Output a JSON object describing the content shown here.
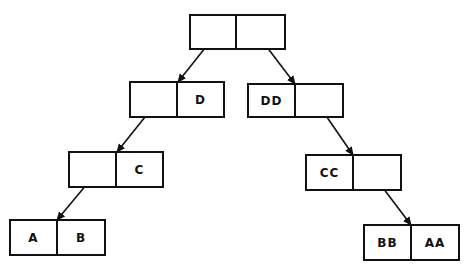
{
  "diagram": {
    "type": "binary-tree-cons-cells",
    "nodes": [
      {
        "id": "root",
        "left": "",
        "right": "",
        "x": 190,
        "y": 15,
        "w": 95,
        "h": 34,
        "div": 236
      },
      {
        "id": "n_left",
        "left": "",
        "right": "D",
        "x": 130,
        "y": 82,
        "w": 94,
        "h": 35,
        "div": 177
      },
      {
        "id": "n_right",
        "left": "DD",
        "right": "",
        "x": 248,
        "y": 84,
        "w": 95,
        "h": 33,
        "div": 295
      },
      {
        "id": "n_c",
        "left": "",
        "right": "C",
        "x": 69,
        "y": 152,
        "w": 94,
        "h": 35,
        "div": 116
      },
      {
        "id": "n_cc",
        "left": "CC",
        "right": "",
        "x": 306,
        "y": 155,
        "w": 95,
        "h": 35,
        "div": 353
      },
      {
        "id": "n_ab",
        "left": "A",
        "right": "B",
        "x": 10,
        "y": 220,
        "w": 95,
        "h": 35,
        "div": 57
      },
      {
        "id": "n_bbaa",
        "left": "BB",
        "right": "AA",
        "x": 364,
        "y": 225,
        "w": 95,
        "h": 35,
        "div": 411
      }
    ],
    "edges": [
      {
        "from": "root.left",
        "to": "n_left",
        "x1": 213,
        "y1": 38,
        "x2": 178,
        "y2": 82
      },
      {
        "from": "root.right",
        "to": "n_right",
        "x1": 260,
        "y1": 38,
        "x2": 295,
        "y2": 84
      },
      {
        "from": "n_left.left",
        "to": "n_c",
        "x1": 153,
        "y1": 107,
        "x2": 117,
        "y2": 152
      },
      {
        "from": "n_right.right",
        "to": "n_cc",
        "x1": 320,
        "y1": 107,
        "x2": 353,
        "y2": 155
      },
      {
        "from": "n_c.left",
        "to": "n_ab",
        "x1": 92,
        "y1": 178,
        "x2": 57,
        "y2": 220
      },
      {
        "from": "n_cc.right",
        "to": "n_bbaa",
        "x1": 377,
        "y1": 180,
        "x2": 411,
        "y2": 225
      }
    ],
    "stroke_color": "#111111"
  }
}
